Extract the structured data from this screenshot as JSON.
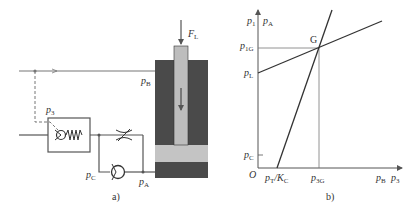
{
  "figure_a": {
    "caption": "a)",
    "labels": {
      "force": "F",
      "force_sub": "L",
      "pB": "p",
      "pB_sub": "B",
      "p3": "p",
      "p3_sub": "3",
      "pC": "p",
      "pC_sub": "C",
      "pA": "p",
      "pA_sub": "A"
    },
    "colors": {
      "cylinder_dark": "#4a4a4a",
      "rod_light": "#bdbdbd",
      "piston_light": "#c4c4c4",
      "cylinder_bottom": "#3a3a3a",
      "line": "#666666"
    }
  },
  "figure_b": {
    "caption": "b)",
    "labels": {
      "y_axis_1": "p",
      "y_axis_1_sub": "1",
      "y_axis_2": "p",
      "y_axis_2_sub": "A",
      "p1G": "p",
      "p1G_sub": "1G",
      "pL": "p",
      "pL_sub": "L",
      "pC": "p",
      "pC_sub": "C",
      "origin": "O",
      "pT": "p",
      "pT_sub": "T",
      "KC": "/K",
      "KC_sub": "C",
      "p3G": "p",
      "p3G_sub": "3G",
      "x_axis_1": "p",
      "x_axis_1_sub": "B",
      "x_axis_2": "p",
      "x_axis_2_sub": "3",
      "point": "G"
    }
  }
}
